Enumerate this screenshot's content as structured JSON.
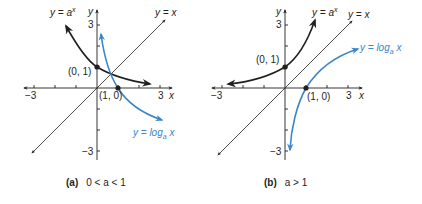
{
  "colors": {
    "axis": "#231f20",
    "exp_curve": "#231f20",
    "log_curve": "#3a86c8",
    "identity_line": "#231f20"
  },
  "panels": [
    {
      "id": "a",
      "caption_label": "(a)",
      "caption_condition": "0 < a < 1",
      "x_axis_label": "x",
      "y_axis_label": "y",
      "tick_neg": "−3",
      "tick_pos": "3",
      "y_tick_pos": "3",
      "y_tick_neg": "−3",
      "exp_label_main": "y = a",
      "exp_label_sup": "x",
      "identity_label": "y = x",
      "log_label_main": "y = log",
      "log_label_sub": "a",
      "log_label_var": " x",
      "point_exp": "(0, 1)",
      "point_log": "(1, 0)"
    },
    {
      "id": "b",
      "caption_label": "(b)",
      "caption_condition": "a > 1",
      "x_axis_label": "x",
      "y_axis_label": "y",
      "tick_neg": "−3",
      "tick_pos": "3",
      "y_tick_pos": "3",
      "y_tick_neg": "−3",
      "exp_label_main": "y = a",
      "exp_label_sup": "x",
      "identity_label": "y = x",
      "log_label_main": "y = log",
      "log_label_sub": "a",
      "log_label_var": " x",
      "point_exp": "(0, 1)",
      "point_log": "(1, 0)"
    }
  ]
}
